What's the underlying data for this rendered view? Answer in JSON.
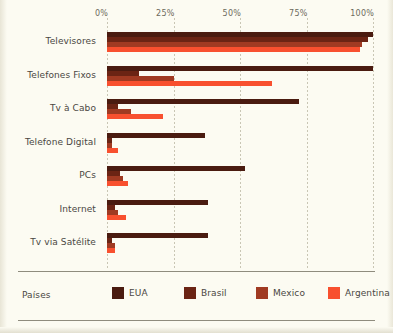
{
  "legend": {
    "title": "Países",
    "items": [
      {
        "label": "EUA",
        "color": "#4a1b10"
      },
      {
        "label": "Brasil",
        "color": "#6b2414"
      },
      {
        "label": "Mexico",
        "color": "#a03a22"
      },
      {
        "label": "Argentina",
        "color": "#f8502f"
      }
    ]
  },
  "chart_data": {
    "type": "bar",
    "orientation": "horizontal",
    "title": "",
    "xlabel": "",
    "ylabel": "",
    "xlim": [
      0,
      100
    ],
    "xunit": "%",
    "grid": true,
    "legend_position": "bottom",
    "xticks": [
      0,
      25,
      50,
      75,
      100
    ],
    "xticklabels": [
      "0%",
      "25%",
      "50%",
      "75%",
      "100%"
    ],
    "categories": [
      "Televisores",
      "Telefones Fixos",
      "Tv à Cabo",
      "Telefone Digital",
      "PCs",
      "Internet",
      "Tv via Satélite"
    ],
    "series": [
      {
        "name": "EUA",
        "color": "#4a1b10",
        "values": [
          100,
          100,
          72,
          37,
          52,
          38,
          38
        ]
      },
      {
        "name": "Brasil",
        "color": "#6b2414",
        "values": [
          98,
          12,
          4,
          2,
          5,
          3,
          2
        ]
      },
      {
        "name": "Mexico",
        "color": "#a03a22",
        "values": [
          96,
          25,
          9,
          2,
          6,
          4,
          3
        ]
      },
      {
        "name": "Argentina",
        "color": "#f8502f",
        "values": [
          95,
          62,
          21,
          4,
          8,
          7,
          3
        ]
      }
    ]
  }
}
